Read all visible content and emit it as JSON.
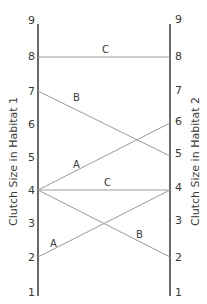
{
  "left_axis": {
    "title": "Clutch Size in Habitat 1",
    "ticks": [
      "1",
      "2",
      "3",
      "4",
      "5",
      "6",
      "7",
      "8",
      "9"
    ]
  },
  "right_axis": {
    "title": "Clutch Size in Habitat 2",
    "ticks": [
      "1",
      "2",
      "3",
      "4",
      "5",
      "6",
      "7",
      "8",
      "9"
    ]
  },
  "connections": [
    {
      "label": "C",
      "from": 8,
      "to": 8
    },
    {
      "label": "B",
      "from": 7,
      "to": 5
    },
    {
      "label": "A",
      "from": 4,
      "to": 6
    },
    {
      "label": "C",
      "from": 4,
      "to": 4
    },
    {
      "label": "B",
      "from": 4,
      "to": 2
    },
    {
      "label": "A",
      "from": 2,
      "to": 4
    }
  ],
  "colors": {
    "axis": "#2a2a2a",
    "connector": "#9a9a9a",
    "text": "#3a3a3a"
  }
}
